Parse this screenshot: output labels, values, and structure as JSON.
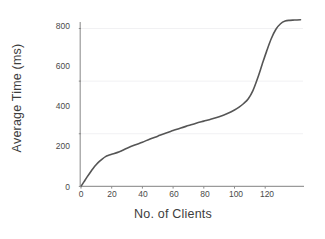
{
  "chart_data": {
    "type": "line",
    "title": "",
    "xlabel": "No. of Clients",
    "ylabel": "Average Time (ms)",
    "xlim": [
      0,
      143
    ],
    "ylim": [
      0,
      840
    ],
    "xticks": [
      0,
      20,
      40,
      60,
      80,
      100,
      120
    ],
    "yticks": [
      0,
      200,
      400,
      600,
      800
    ],
    "grid": "horizontal-only",
    "legend": "none",
    "line_color": "#555555",
    "line_width": 1.6,
    "series": [
      {
        "name": "Average Time",
        "x": [
          0,
          2,
          4,
          6,
          8,
          10,
          12,
          14,
          16,
          18,
          20,
          25,
          30,
          35,
          40,
          45,
          50,
          55,
          60,
          65,
          70,
          75,
          80,
          85,
          90,
          95,
          100,
          103,
          106,
          109,
          112,
          115,
          118,
          121,
          124,
          127,
          130,
          133,
          136,
          139,
          143
        ],
        "y": [
          0,
          18,
          36,
          53,
          69,
          83,
          95,
          105,
          113,
          118,
          122,
          132,
          145,
          157,
          168,
          180,
          191,
          202,
          212,
          222,
          231,
          240,
          248,
          256,
          265,
          276,
          290,
          301,
          315,
          333,
          364,
          410,
          463,
          515,
          562,
          597,
          618,
          628,
          631,
          632,
          633
        ]
      }
    ]
  },
  "axes": {
    "ylabel_text": "Average Time (ms)",
    "xlabel_text": "No. of Clients",
    "ytick_labels": [
      "800",
      "600",
      "400",
      "200",
      "0"
    ],
    "xtick_labels": [
      "0",
      "20",
      "40",
      "60",
      "80",
      "100",
      "120"
    ]
  },
  "colors": {
    "line": "#555555",
    "axis": "#8a8a8a",
    "grid": "#f1f1f3",
    "text": "#3d3d3d"
  }
}
